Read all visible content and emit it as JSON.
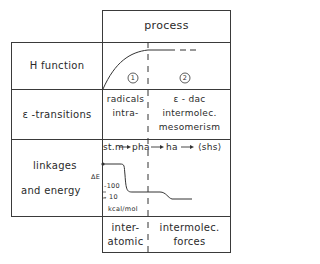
{
  "header": {
    "process_label": "process"
  },
  "rows": [
    {
      "label": "H function"
    },
    {
      "label": "ε -transitions"
    },
    {
      "label_line1": "linkages",
      "label_line2": "and  energy"
    }
  ],
  "h_function": {
    "phase1_marker": "1",
    "phase2_marker": "2"
  },
  "transitions": {
    "left_line1": "radicals",
    "left_line2": "intra-",
    "right_line1": "ε - dac",
    "right_line2": "intermolec.",
    "right_line3": "mesomerism"
  },
  "linkages": {
    "sequence": [
      "st.m",
      "pha",
      "ha",
      "⟨shs⟩"
    ],
    "axis_label": "ΔE",
    "tick_100": "-100",
    "tick_10": "- 10",
    "unit": "kcal/mol"
  },
  "footer": {
    "left_line1": "inter-",
    "left_line2": "atomic",
    "right_line1": "intermolec.",
    "right_line2": "forces"
  }
}
